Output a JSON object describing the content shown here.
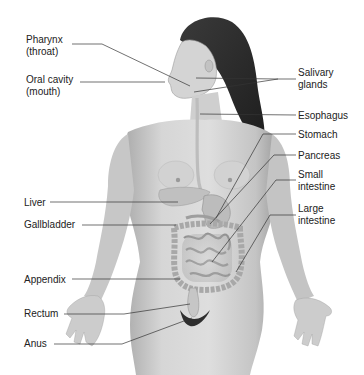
{
  "diagram": {
    "labels_left": [
      {
        "id": "pharynx",
        "lines": [
          "Pharynx",
          "(throat)"
        ],
        "x": 26,
        "y": 34
      },
      {
        "id": "oral-cavity",
        "lines": [
          "Oral cavity",
          "(mouth)"
        ],
        "x": 26,
        "y": 74
      },
      {
        "id": "liver",
        "lines": [
          "Liver"
        ],
        "x": 24,
        "y": 197
      },
      {
        "id": "gallbladder",
        "lines": [
          "Gallbladder"
        ],
        "x": 24,
        "y": 219
      },
      {
        "id": "appendix",
        "lines": [
          "Appendix"
        ],
        "x": 24,
        "y": 274
      },
      {
        "id": "rectum",
        "lines": [
          "Rectum"
        ],
        "x": 24,
        "y": 308
      },
      {
        "id": "anus",
        "lines": [
          "Anus"
        ],
        "x": 24,
        "y": 338
      }
    ],
    "labels_right": [
      {
        "id": "salivary-glands",
        "lines": [
          "Salivary",
          "glands"
        ],
        "x": 298,
        "y": 67
      },
      {
        "id": "esophagus",
        "lines": [
          "Esophagus"
        ],
        "x": 298,
        "y": 111
      },
      {
        "id": "stomach",
        "lines": [
          "Stomach"
        ],
        "x": 298,
        "y": 130
      },
      {
        "id": "pancreas",
        "lines": [
          "Pancreas"
        ],
        "x": 298,
        "y": 151
      },
      {
        "id": "small-intestine",
        "lines": [
          "Small",
          "intestine"
        ],
        "x": 298,
        "y": 170
      },
      {
        "id": "large-intestine",
        "lines": [
          "Large",
          "intestine"
        ],
        "x": 298,
        "y": 203
      }
    ],
    "colors": {
      "background": "#ffffff",
      "text": "#222222",
      "leader_line": "#333333",
      "skin_light": "#d9d9d9",
      "skin_mid": "#b8b8b8",
      "skin_dark": "#8a8a8a",
      "hair": "#2a2a2a",
      "organ": "#c9c9c9"
    }
  }
}
